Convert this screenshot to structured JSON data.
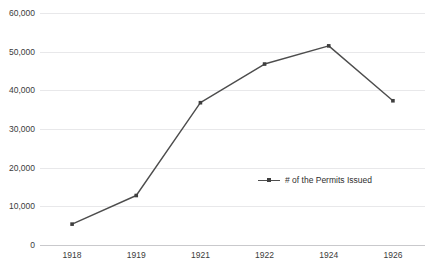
{
  "chart_data": {
    "type": "line",
    "title": "",
    "subtitle": "",
    "xlabel": "",
    "ylabel": "",
    "categories": [
      "1918",
      "1919",
      "1921",
      "1922",
      "1924",
      "1926"
    ],
    "series": [
      {
        "name": "# of the Permits Issued",
        "values": [
          5400,
          12800,
          36800,
          46800,
          51500,
          37300
        ]
      }
    ],
    "ylim": [
      0,
      60000
    ],
    "ytick_labels": [
      "60,000",
      "50,000",
      "40,000",
      "30,000",
      "20,000",
      "10,000",
      "0"
    ],
    "ytick_values": [
      60000,
      50000,
      40000,
      30000,
      20000,
      10000,
      0
    ],
    "xtick_labels": [
      "1918",
      "1919",
      "1921",
      "1922",
      "1924",
      "1926"
    ],
    "grid": "horizontal",
    "legend_position": "center-right",
    "marker": "square",
    "colors": {
      "line": "#4d4d4d",
      "marker": "#3f3f3f",
      "gridline": "#e8e8ea",
      "axis": "#c9c9cc",
      "tick_text": "#3b3b3b",
      "background": "#ffffff"
    }
  },
  "legend": {
    "entries": [
      {
        "label": "# of the Permits Issued",
        "marker_name": "line-marker-swatch"
      }
    ]
  },
  "artifacts": {
    "ghost_top": "",
    "ghost_second": ""
  }
}
